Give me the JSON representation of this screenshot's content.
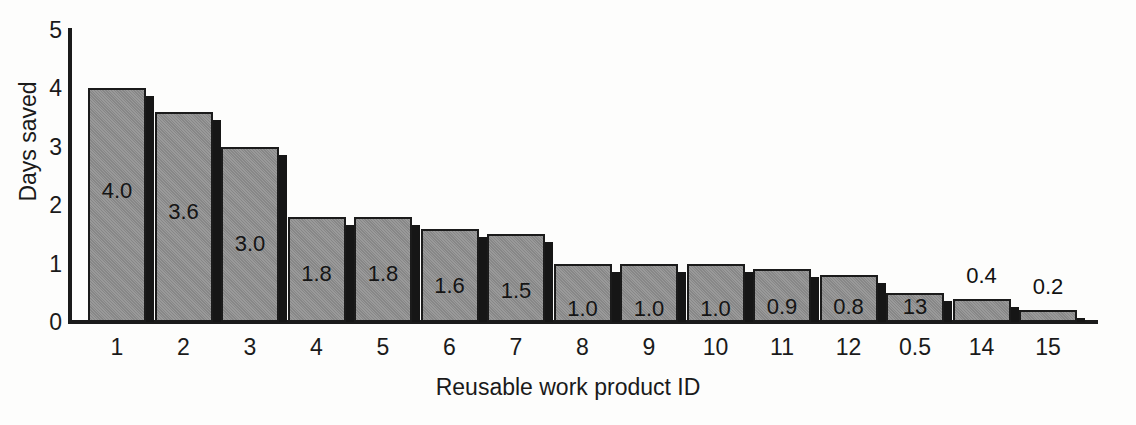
{
  "chart_data": {
    "type": "bar",
    "title": "",
    "xlabel": "Reusable work product ID",
    "ylabel": "Days saved",
    "ylim": [
      0,
      5
    ],
    "ytick_labels": [
      "0",
      "1",
      "2",
      "3",
      "4",
      "5"
    ],
    "ytick_values": [
      0,
      1,
      2,
      3,
      4,
      5
    ],
    "grid": false,
    "legend": null,
    "categories": [
      "1",
      "2",
      "3",
      "4",
      "5",
      "6",
      "7",
      "8",
      "9",
      "10",
      "11",
      "12",
      "0.5",
      "14",
      "15"
    ],
    "values": [
      4.0,
      3.6,
      3.0,
      1.8,
      1.8,
      1.6,
      1.5,
      1.0,
      1.0,
      1.0,
      0.9,
      0.8,
      0.5,
      0.4,
      0.2
    ],
    "data_labels": [
      "4.0",
      "3.6",
      "3.0",
      "1.8",
      "1.8",
      "1.6",
      "1.5",
      "1.0",
      "1.0",
      "1.0",
      "0.9",
      "0.8",
      "13",
      "0.4",
      "0.2"
    ],
    "label_placement": [
      "inside",
      "inside",
      "inside",
      "inside",
      "inside",
      "inside",
      "inside",
      "inside",
      "inside",
      "inside",
      "inside",
      "inside",
      "inside",
      "above",
      "above"
    ],
    "bar_color": "#8e8e8e",
    "bar_edge_color": "#1b1b1b",
    "bar_shadow_color": "#161616",
    "background_color": "#fdfdfc",
    "text_color": "#1a1a1a"
  },
  "axes": {
    "y_title": "Days saved",
    "x_title": "Reusable work product ID"
  }
}
